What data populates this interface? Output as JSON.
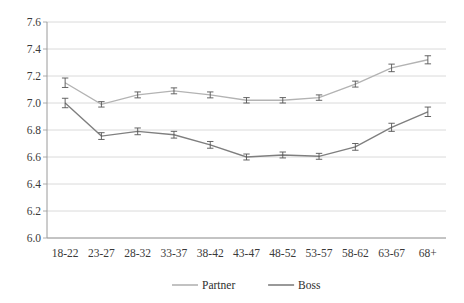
{
  "chart_data": {
    "type": "line",
    "title": "",
    "xlabel": "",
    "ylabel": "",
    "categories": [
      "18-22",
      "23-27",
      "28-32",
      "33-37",
      "38-42",
      "43-47",
      "48-52",
      "53-57",
      "58-62",
      "63-67",
      "68+"
    ],
    "ylim": [
      6.0,
      7.6
    ],
    "yticks": [
      "6.0",
      "6.2",
      "6.4",
      "6.6",
      "6.8",
      "7.0",
      "7.2",
      "7.4",
      "7.6"
    ],
    "ytick_values": [
      6.0,
      6.2,
      6.4,
      6.6,
      6.8,
      7.0,
      7.2,
      7.4,
      7.6
    ],
    "grid": true,
    "legend_position": "bottom",
    "error_bars": true,
    "series": [
      {
        "name": "Partner",
        "color": "#b3b3b3",
        "values": [
          7.15,
          6.99,
          7.06,
          7.09,
          7.06,
          7.02,
          7.02,
          7.04,
          7.14,
          7.26,
          7.32
        ],
        "errors": [
          0.035,
          0.02,
          0.022,
          0.022,
          0.022,
          0.02,
          0.02,
          0.02,
          0.022,
          0.028,
          0.03
        ]
      },
      {
        "name": "Boss",
        "color": "#7f7f7f",
        "values": [
          7.0,
          6.755,
          6.79,
          6.765,
          6.69,
          6.6,
          6.615,
          6.605,
          6.675,
          6.82,
          6.935
        ],
        "errors": [
          0.035,
          0.025,
          0.025,
          0.025,
          0.025,
          0.022,
          0.022,
          0.022,
          0.025,
          0.03,
          0.035
        ]
      }
    ]
  },
  "legend": {
    "items": [
      {
        "label": "Partner",
        "color": "#b3b3b3"
      },
      {
        "label": "Boss",
        "color": "#7f7f7f"
      }
    ]
  },
  "axis": {
    "y_labels": [
      "7.6",
      "7.4",
      "7.2",
      "7.0",
      "6.8",
      "6.6",
      "6.4",
      "6.2",
      "6.0"
    ],
    "x_labels": [
      "18-22",
      "23-27",
      "28-32",
      "33-37",
      "38-42",
      "43-47",
      "48-52",
      "53-57",
      "58-62",
      "63-67",
      "68+"
    ]
  }
}
